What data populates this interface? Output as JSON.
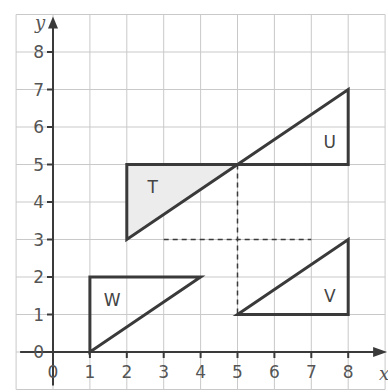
{
  "diagram": {
    "type": "coordinate-grid-transformations",
    "axes": {
      "x_label": "x",
      "y_label": "y",
      "x_ticks": [
        "0",
        "1",
        "2",
        "3",
        "4",
        "5",
        "6",
        "7",
        "8"
      ],
      "y_ticks": [
        "0",
        "1",
        "2",
        "3",
        "4",
        "5",
        "6",
        "7",
        "8"
      ],
      "x_range": [
        -1,
        9
      ],
      "y_range": [
        -1,
        9
      ]
    },
    "shapes": [
      {
        "label": "T",
        "vertices": [
          [
            2,
            3
          ],
          [
            2,
            5
          ],
          [
            5,
            5
          ]
        ],
        "fill": "#ececec",
        "label_pos": [
          2.7,
          4.4
        ]
      },
      {
        "label": "U",
        "vertices": [
          [
            5,
            5
          ],
          [
            8,
            5
          ],
          [
            8,
            7
          ]
        ],
        "fill": "none",
        "label_pos": [
          7.5,
          5.6
        ]
      },
      {
        "label": "V",
        "vertices": [
          [
            5,
            1
          ],
          [
            8,
            1
          ],
          [
            8,
            3
          ]
        ],
        "fill": "none",
        "label_pos": [
          7.5,
          1.5
        ]
      },
      {
        "label": "W",
        "vertices": [
          [
            1,
            0
          ],
          [
            1,
            2
          ],
          [
            4,
            2
          ]
        ],
        "fill": "none",
        "label_pos": [
          1.6,
          1.4
        ]
      }
    ],
    "dashed_lines": [
      {
        "from": [
          3,
          3
        ],
        "to": [
          7,
          3
        ]
      },
      {
        "from": [
          5,
          5
        ],
        "to": [
          5,
          1
        ]
      }
    ],
    "colors": {
      "grid": "#c9c9c9",
      "outline": "#3a3a3a",
      "axis": "#3a3a3a",
      "t_fill": "#ececec"
    }
  }
}
